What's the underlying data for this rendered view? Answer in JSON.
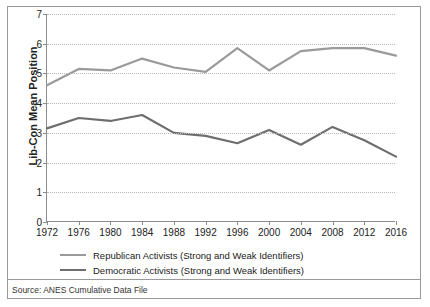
{
  "chart_data": {
    "type": "line",
    "title": "",
    "xlabel": "",
    "ylabel": "Lib-Con Mean Position",
    "ylim": [
      0,
      7
    ],
    "yticks": [
      0,
      1,
      2,
      3,
      4,
      5,
      6,
      7
    ],
    "grid": true,
    "legend_position": "bottom",
    "categories": [
      "1972",
      "1976",
      "1980",
      "1984",
      "1988",
      "1992",
      "1996",
      "2000",
      "2004",
      "2008",
      "2012",
      "2016"
    ],
    "series": [
      {
        "name": "Republican Activists (Strong and Weak Identifiers)",
        "color": "#9a9a9a",
        "values": [
          4.6,
          5.15,
          5.1,
          5.5,
          5.2,
          5.05,
          5.85,
          5.1,
          5.75,
          5.85,
          5.85,
          5.6
        ]
      },
      {
        "name": "Democratic Activists (Strong and Weak Identifiers)",
        "color": "#6e6e6e",
        "values": [
          3.15,
          3.5,
          3.4,
          3.6,
          3.0,
          2.9,
          2.65,
          3.1,
          2.6,
          3.2,
          2.75,
          2.2
        ]
      }
    ],
    "source": "Source: ANES Cumulative Data File"
  }
}
